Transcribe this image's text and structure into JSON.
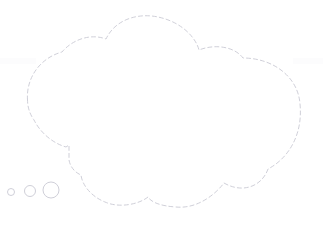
{
  "canvas": {
    "width": 323,
    "height": 228,
    "background_color": "#ffffff",
    "title": "Thought Bubble"
  },
  "style": {
    "stroke_color": "#c9c9d4",
    "stroke_width": 0.9,
    "dash_pattern": "4 3",
    "fill_color": "#ffffff",
    "faint_band_color": "#fcfcfd"
  },
  "shapes": {
    "bubble": {
      "name": "thought-bubble",
      "label": "Cloud shaped dashed thought bubble outline",
      "path": "M 27.5 100 C 26 78 40 58 62 52 C 72 40 90 33 106 39 C 116 18 140 13 158 17 C 182 22 196 38 199 50 C 214 44 234 46 243 58 C 272 58 298 76 300 104 C 303 134 289 158 268 169 C 262 186 243 194 224 183 C 214 196 196 209 176 207 C 160 206 151 202 148 197 C 138 205 118 208 105 202 C 90 196 82 184 81 175 C 74 172 70 166 69 160 L 69 145 L 66 147 C 52 143 40 132 34 120 C 29 113 27.6 106 27.5 100 Z"
    },
    "tail_dots": [
      {
        "name": "tail-dot-large",
        "cx": 51,
        "cy": 190,
        "r": 8
      },
      {
        "name": "tail-dot-medium",
        "cx": 30,
        "cy": 191,
        "r": 5.5
      },
      {
        "name": "tail-dot-small",
        "cx": 11,
        "cy": 192,
        "r": 3.5
      }
    ]
  }
}
